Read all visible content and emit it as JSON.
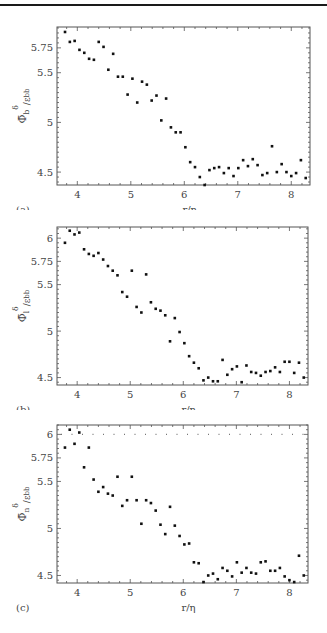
{
  "figure": {
    "panels": [
      {
        "tag": "(a)",
        "ylabel_main": "Φ̄",
        "ylabel_sub": "b",
        "ylabel_sup": "δ",
        "ylabel_tail": "/ε",
        "ylabel_tail_sub": "bb",
        "xlabel": "r/η"
      },
      {
        "tag": "(b)",
        "ylabel_main": "Φ̄",
        "ylabel_sub": "l",
        "ylabel_sup": "δ",
        "ylabel_tail": "/ε",
        "ylabel_tail_sub": "bb",
        "xlabel": "r/η"
      },
      {
        "tag": "(c)",
        "ylabel_main": "Φ̄",
        "ylabel_sub": "n",
        "ylabel_sup": "δ",
        "ylabel_tail": "/ε",
        "ylabel_tail_sub": "bb",
        "xlabel": "r/η"
      }
    ]
  },
  "chart_data": [
    {
      "type": "scatter",
      "title": "(a)",
      "xlabel": "r/η",
      "ylabel": "Φ̄_b^δ/ε_bb",
      "xticks": [
        4,
        5,
        6,
        7,
        8
      ],
      "yticks": [
        4.5,
        5,
        5.5,
        5.75
      ],
      "xlim": [
        3.62,
        8.35
      ],
      "ylim": [
        4.37,
        5.96
      ],
      "grid": false,
      "frame": {
        "top": 27,
        "bottom": 185,
        "left": 57,
        "right": 310
      },
      "x": [
        3.77,
        3.86,
        3.95,
        4.04,
        4.13,
        4.22,
        4.31,
        4.4,
        4.49,
        4.58,
        4.67,
        4.76,
        4.85,
        4.94,
        5.03,
        5.12,
        5.21,
        5.3,
        5.39,
        5.48,
        5.57,
        5.66,
        5.75,
        5.84,
        5.93,
        6.02,
        6.11,
        6.2,
        6.29,
        6.38,
        6.47,
        6.56,
        6.65,
        6.74,
        6.83,
        6.92,
        7.01,
        7.1,
        7.19,
        7.28,
        7.37,
        7.46,
        7.55,
        7.64,
        7.73,
        7.82,
        7.91,
        8.0,
        8.09,
        8.18,
        8.27
      ],
      "y": [
        5.91,
        5.81,
        5.82,
        5.73,
        5.7,
        5.64,
        5.63,
        5.81,
        5.76,
        5.53,
        5.69,
        5.46,
        5.46,
        5.28,
        5.44,
        5.2,
        5.41,
        5.38,
        5.22,
        5.27,
        5.02,
        5.24,
        4.95,
        4.9,
        4.9,
        4.75,
        4.6,
        4.55,
        4.45,
        4.37,
        4.52,
        4.54,
        4.55,
        4.49,
        4.54,
        4.46,
        4.54,
        4.62,
        4.56,
        4.63,
        4.57,
        4.47,
        4.49,
        4.76,
        4.5,
        4.58,
        4.5,
        4.46,
        4.49,
        4.62,
        4.44
      ]
    },
    {
      "type": "scatter",
      "title": "(b)",
      "xlabel": "r/η",
      "ylabel": "Φ̄_l^δ/ε_bb",
      "xticks": [
        4,
        5,
        6,
        7,
        8
      ],
      "yticks": [
        4.5,
        5,
        5.5,
        5.75,
        6
      ],
      "xlim": [
        3.62,
        8.35
      ],
      "ylim": [
        4.42,
        6.12
      ],
      "grid": false,
      "frame": {
        "top": 227,
        "bottom": 385,
        "left": 57,
        "right": 308
      },
      "x": [
        3.77,
        3.86,
        3.95,
        4.04,
        4.13,
        4.22,
        4.31,
        4.4,
        4.49,
        4.58,
        4.67,
        4.76,
        4.85,
        4.94,
        5.03,
        5.12,
        5.21,
        5.3,
        5.39,
        5.48,
        5.57,
        5.66,
        5.75,
        5.84,
        5.93,
        6.02,
        6.11,
        6.2,
        6.29,
        6.38,
        6.47,
        6.56,
        6.65,
        6.74,
        6.83,
        6.92,
        7.01,
        7.1,
        7.19,
        7.28,
        7.37,
        7.46,
        7.55,
        7.64,
        7.73,
        7.82,
        7.91,
        8.0,
        8.09,
        8.18,
        8.27
      ],
      "y": [
        5.95,
        6.08,
        6.04,
        6.06,
        5.88,
        5.83,
        5.81,
        5.84,
        5.77,
        5.7,
        5.65,
        5.6,
        5.42,
        5.37,
        5.65,
        5.26,
        5.2,
        5.61,
        5.31,
        5.24,
        5.22,
        5.17,
        4.89,
        5.14,
        4.99,
        4.87,
        4.73,
        4.66,
        4.6,
        4.47,
        4.5,
        4.46,
        4.46,
        4.69,
        4.53,
        4.59,
        4.62,
        4.45,
        4.63,
        4.56,
        4.55,
        4.52,
        4.56,
        4.57,
        4.61,
        4.56,
        4.67,
        4.67,
        4.55,
        4.66,
        4.5
      ]
    },
    {
      "type": "scatter",
      "title": "(c)",
      "xlabel": "r/η",
      "ylabel": "Φ̄_n^δ/ε_bb",
      "xticks": [
        4,
        5,
        6,
        7,
        8
      ],
      "yticks": [
        4.5,
        5,
        5.5,
        5.75,
        6
      ],
      "xlim": [
        3.62,
        8.35
      ],
      "ylim": [
        4.42,
        6.1
      ],
      "grid": false,
      "reference_line": {
        "y": 6,
        "style": "dotted"
      },
      "frame": {
        "top": 425,
        "bottom": 583,
        "left": 57,
        "right": 308
      },
      "x": [
        3.77,
        3.86,
        3.95,
        4.04,
        4.13,
        4.22,
        4.31,
        4.4,
        4.49,
        4.58,
        4.67,
        4.76,
        4.85,
        4.94,
        5.03,
        5.12,
        5.21,
        5.3,
        5.39,
        5.48,
        5.57,
        5.66,
        5.75,
        5.84,
        5.93,
        6.02,
        6.11,
        6.2,
        6.29,
        6.38,
        6.47,
        6.56,
        6.65,
        6.74,
        6.83,
        6.92,
        7.01,
        7.1,
        7.19,
        7.28,
        7.37,
        7.46,
        7.55,
        7.64,
        7.73,
        7.82,
        7.91,
        8.0,
        8.09,
        8.18,
        8.27
      ],
      "y": [
        5.86,
        6.05,
        5.9,
        6.02,
        5.65,
        5.86,
        5.52,
        5.39,
        5.44,
        5.37,
        5.35,
        5.55,
        5.24,
        5.3,
        5.55,
        5.3,
        5.05,
        5.3,
        5.27,
        5.19,
        5.04,
        4.94,
        5.23,
        5.03,
        4.92,
        4.83,
        4.84,
        4.64,
        4.63,
        4.43,
        4.5,
        4.52,
        4.46,
        4.58,
        4.55,
        4.49,
        4.64,
        4.53,
        4.58,
        4.53,
        4.52,
        4.64,
        4.65,
        4.55,
        4.55,
        4.58,
        4.49,
        4.45,
        4.43,
        4.71,
        4.5
      ]
    }
  ]
}
